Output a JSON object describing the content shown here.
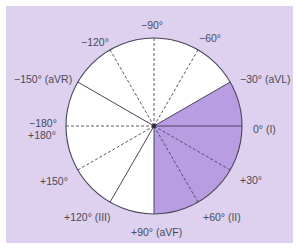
{
  "colors": {
    "panel_background": "#ddd1ef",
    "circle_fill": "#ffffff",
    "shaded_sector": "#b99de3",
    "line": "#4a4458"
  },
  "diagram": {
    "center": [
      154,
      126
    ],
    "radius": 88,
    "shaded_range_degrees": [
      -30,
      90
    ],
    "rays": [
      {
        "angle": -90,
        "style": "dashed"
      },
      {
        "angle": -60,
        "style": "dashed"
      },
      {
        "angle": -30,
        "style": "solid"
      },
      {
        "angle": 0,
        "style": "solid"
      },
      {
        "angle": 30,
        "style": "dashed"
      },
      {
        "angle": 60,
        "style": "dashed"
      },
      {
        "angle": 90,
        "style": "solid"
      },
      {
        "angle": 120,
        "style": "solid"
      },
      {
        "angle": 150,
        "style": "dashed"
      },
      {
        "angle": 180,
        "style": "dashed"
      },
      {
        "angle": -150,
        "style": "solid"
      },
      {
        "angle": -120,
        "style": "dashed"
      }
    ]
  },
  "labels": {
    "neg90": "−90°",
    "neg60": "−60°",
    "neg30": "−30° (aVL)",
    "zero": "0° (I)",
    "pos30": "+30°",
    "pos60": "+60° (II)",
    "pos90": "+90° (aVF)",
    "pos120": "+120° (III)",
    "pos150": "+150°",
    "neg180": "−180°",
    "pos180": "+180°",
    "neg150": "−150° (aVR)",
    "neg120": "−120°"
  }
}
